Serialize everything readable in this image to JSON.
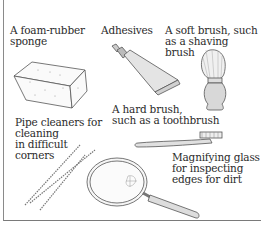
{
  "illustration": {
    "title": "Cleaning tools",
    "items": [
      {
        "id": "sponge",
        "label": "A foam-rubber\nsponge"
      },
      {
        "id": "adhesives",
        "label": "Adhesives"
      },
      {
        "id": "soft-brush",
        "label": "A soft brush, such\nas a shaving\nbrush"
      },
      {
        "id": "hard-brush",
        "label": "A hard brush,\nsuch as a toothbrush"
      },
      {
        "id": "pipe-cleaners",
        "label": "Pipe cleaners for\ncleaning\nin difficult\ncorners"
      },
      {
        "id": "magnifying-glass",
        "label": "Magnifying glass\nfor inspecting\nedges for dirt"
      }
    ]
  },
  "colors": {
    "line": "#555555",
    "text": "#2b2b2b",
    "border": "#7a7a7a"
  }
}
